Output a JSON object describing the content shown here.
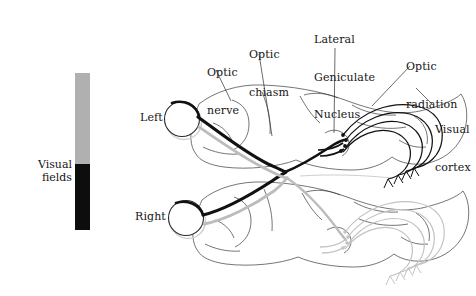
{
  "figure": {
    "colors": {
      "upper_field_gray": "#b0b0b0",
      "lower_field_black": "#0d0d0d",
      "pathway_dark": "#111111",
      "pathway_light": "#bcbcbc",
      "outline": "#3a3a3a",
      "background": "#ffffff"
    }
  },
  "visual_fields": {
    "label": "Visual fields",
    "bar": {
      "upper_segment_name": "upper-visual-field",
      "lower_segment_name": "lower-visual-field"
    }
  },
  "eyes": {
    "left_label": "Left",
    "right_label": "Right"
  },
  "annotations": [
    {
      "id": "optic-nerve",
      "text": "Optic\nnerve",
      "line1": "Optic",
      "line2": "nerve",
      "line3": ""
    },
    {
      "id": "optic-chiasm",
      "text": "Optic\nchiasm",
      "line1": "Optic",
      "line2": "chiasm",
      "line3": ""
    },
    {
      "id": "lateral-geniculate-nucleus",
      "text": "Lateral\nGeniculate\nNucleus",
      "line1": "Lateral",
      "line2": "Geniculate",
      "line3": "Nucleus"
    },
    {
      "id": "optic-radiation",
      "text": "Optic\nradiation",
      "line1": "Optic",
      "line2": "radiation",
      "line3": ""
    },
    {
      "id": "visual-cortex",
      "text": "Visual\ncortex",
      "line1": "Visual",
      "line2": "cortex",
      "line3": ""
    }
  ]
}
